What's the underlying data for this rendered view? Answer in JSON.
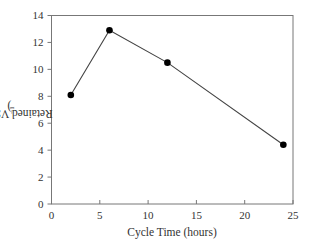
{
  "chart_data": {
    "type": "line",
    "title": "",
    "xlabel": "Cycle Time (hours)",
    "ylabel": "Retained VSS (g L⁻¹)",
    "ylabel_main": "Retained VSS (g L",
    "ylabel_sup": "−1",
    "ylabel_close": ")",
    "xlim": [
      0,
      25
    ],
    "ylim": [
      0,
      14
    ],
    "xticks": [
      "0",
      "5",
      "10",
      "15",
      "20",
      "25"
    ],
    "yticks": [
      "0",
      "2",
      "4",
      "6",
      "8",
      "10",
      "12",
      "14"
    ],
    "grid": false,
    "legend": null,
    "series": [
      {
        "name": "Retained VSS",
        "marker": "filled-circle",
        "color": "#000000",
        "x": [
          2,
          6,
          12,
          24
        ],
        "y": [
          8.1,
          12.9,
          10.5,
          4.4
        ]
      }
    ]
  }
}
